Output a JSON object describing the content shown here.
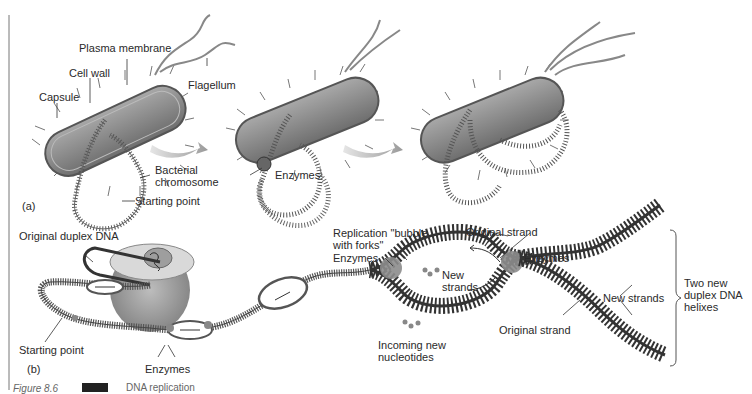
{
  "figure": {
    "caption_prefix": "Figure 8.6",
    "caption_badge": "",
    "caption_title": "DNA replication"
  },
  "panel_a": {
    "label": "(a)",
    "labels": {
      "plasma_membrane": "Plasma membrane",
      "cell_wall": "Cell wall",
      "capsule": "Capsule",
      "flagellum": "Flagellum",
      "bacterial_chromosome": "Bacterial\nchromosome",
      "starting_point": "Starting point",
      "enzymes": "Enzymes"
    }
  },
  "panel_b": {
    "label": "(b)",
    "labels": {
      "original_duplex_dna": "Original duplex DNA",
      "starting_point": "Starting point",
      "enzymes_bottom": "Enzymes",
      "replication_bubble": "Replication \"bubble\nwith forks\"",
      "enzymes_left": "Enzymes",
      "original_strand_top": "Original  strand",
      "enzymes_right": "Enzymes",
      "new_strands_inner": "New\nstrands",
      "incoming_nucleotides": "Incoming new\nnucleotides",
      "original_strand_bottom": "Original strand",
      "new_strands_right": "New strands",
      "two_new_helixes": "Two new\nduplex DNA\nhelixes"
    }
  },
  "colors": {
    "cell_body": "#8a8a8a",
    "cell_outline": "#555555",
    "dna_strand": "#444444",
    "enzyme": "#8c8c8c",
    "arrow": "#b0b0b0"
  }
}
